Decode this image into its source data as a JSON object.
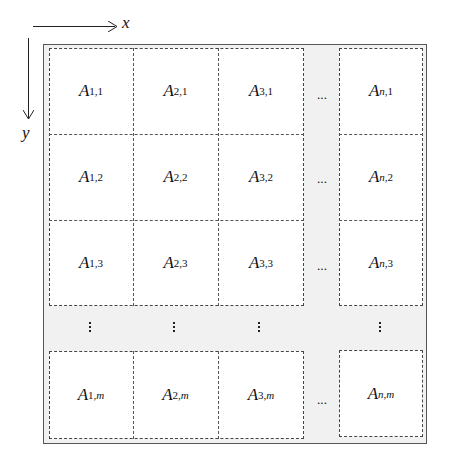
{
  "axes": {
    "x_label": "x",
    "y_label": "y"
  },
  "grid": {
    "columns": [
      "1",
      "2",
      "3",
      "n"
    ],
    "rows": [
      "1",
      "2",
      "3",
      "m"
    ],
    "base_symbol": "A",
    "horizontal_ellipsis": "···",
    "cells": [
      [
        {
          "base": "A",
          "sub": "1,1"
        },
        {
          "base": "A",
          "sub": "2,1"
        },
        {
          "base": "A",
          "sub": "3,1"
        },
        {
          "base": "A",
          "sub": "n,1"
        }
      ],
      [
        {
          "base": "A",
          "sub": "1,2"
        },
        {
          "base": "A",
          "sub": "2,2"
        },
        {
          "base": "A",
          "sub": "3,2"
        },
        {
          "base": "A",
          "sub": "n,2"
        }
      ],
      [
        {
          "base": "A",
          "sub": "1,3"
        },
        {
          "base": "A",
          "sub": "2,3"
        },
        {
          "base": "A",
          "sub": "3,3"
        },
        {
          "base": "A",
          "sub": "n,3"
        }
      ],
      [
        {
          "base": "A",
          "sub": "1,m"
        },
        {
          "base": "A",
          "sub": "2,m"
        },
        {
          "base": "A",
          "sub": "3,m"
        },
        {
          "base": "A",
          "sub": "n,m"
        }
      ]
    ]
  },
  "colors": {
    "frame_border": "#555555",
    "background_gap": "#f1f1f1",
    "cell_fill": "#ffffff"
  }
}
